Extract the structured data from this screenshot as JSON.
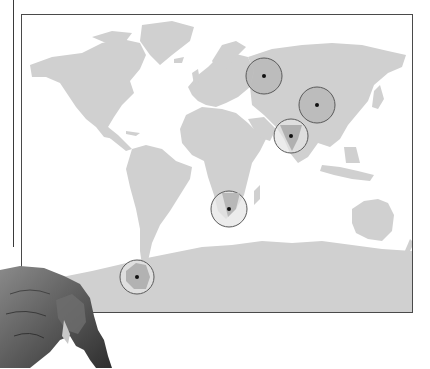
{
  "figure": {
    "type": "world-map-with-fossil-locations",
    "title": "",
    "map": {
      "land_color": "#cfcfcf",
      "water_color": "#ffffff",
      "frame_color": "#4a4a4a"
    },
    "markers": [
      {
        "name": "russia-site",
        "cx": 242,
        "cy": 61,
        "r": 18,
        "fill": "#b8b8b8"
      },
      {
        "name": "china-site",
        "cx": 295,
        "cy": 90,
        "r": 18,
        "fill": "#b8b8b8"
      },
      {
        "name": "india-site",
        "cx": 269,
        "cy": 121,
        "r": 17,
        "fill": "#b8b8b8"
      },
      {
        "name": "south-africa-site",
        "cx": 207,
        "cy": 194,
        "r": 18,
        "fill": "#b8b8b8"
      },
      {
        "name": "antarctica-site",
        "cx": 115,
        "cy": 262,
        "r": 17,
        "fill": "#b8b8b8"
      }
    ],
    "marker_style": {
      "stroke": "#5a5a5a",
      "dot_color": "#111111"
    },
    "illustration": {
      "subject": "dicynodont-reptile",
      "position": "bottom-left"
    }
  }
}
